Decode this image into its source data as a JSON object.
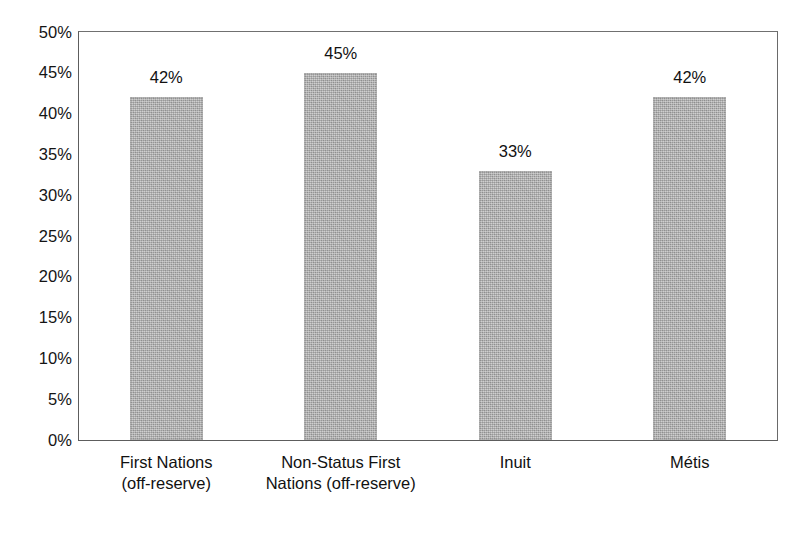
{
  "chart_data": {
    "type": "bar",
    "title": "",
    "subtitle": "",
    "xlabel": "",
    "ylabel": "",
    "categories": [
      "First Nations (off-reserve)",
      "Non-Status First Nations (off-reserve)",
      "Inuit",
      "Métis"
    ],
    "category_lines": [
      [
        "First Nations",
        "(off-reserve)"
      ],
      [
        "Non-Status First",
        "Nations (off-reserve)"
      ],
      [
        "Inuit",
        ""
      ],
      [
        "Métis",
        ""
      ]
    ],
    "values": [
      42,
      45,
      33,
      42
    ],
    "value_labels": [
      "42%",
      "45%",
      "33%",
      "42%"
    ],
    "ylim": [
      0,
      50
    ],
    "ytick_values": [
      50,
      45,
      40,
      35,
      30,
      25,
      20,
      15,
      10,
      5,
      0
    ],
    "ytick_labels": [
      "50%",
      "45%",
      "40%",
      "35%",
      "30%",
      "25%",
      "20%",
      "15%",
      "10%",
      "5%",
      "0%"
    ],
    "grid": false,
    "legend": "none",
    "bar_color": "#adadad",
    "frame_color": "#5d5d5d",
    "text_color": "#111111"
  }
}
